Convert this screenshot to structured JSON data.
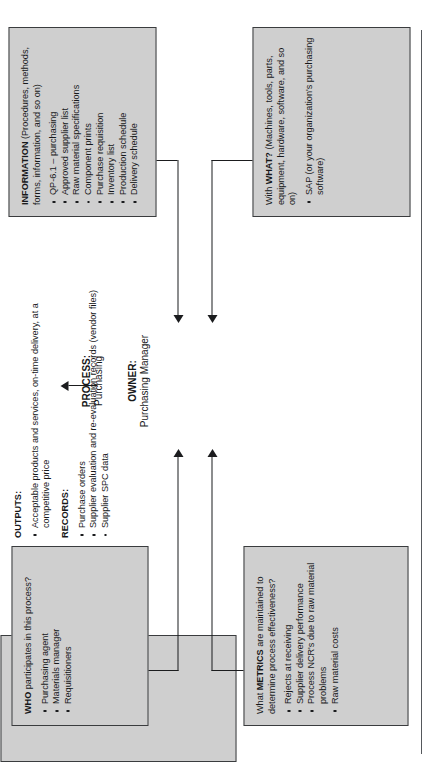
{
  "diagram": {
    "type": "process-map",
    "orientation": "rotated-90-ccw",
    "process": {
      "process_label": "PROCESS:",
      "process_value": "Purchasing",
      "owner_label": "OWNER:",
      "owner_value": "Purchasing Manager"
    },
    "who": {
      "title_prefix": "WHO",
      "title_rest": " participates in this process?",
      "items": [
        "Purchasing agent",
        "Materials manager",
        "Requisitioners"
      ]
    },
    "metrics": {
      "title_pre": "What ",
      "title_kw": "METRICS",
      "title_post": " are maintained to determine process effectiveness?",
      "items": [
        "Rejects at receiving",
        "Supplier delivery performance",
        "Process NCR's due to raw material problems",
        "Raw material costs"
      ]
    },
    "information": {
      "title_kw": "INFORMATION",
      "title_post": " (Procedures, methods, forms, information, and so on)",
      "items": [
        "QP-6.1 – purchasing",
        "Approved supplier list",
        "Raw material specifications",
        "Component prints",
        "Purchase requisition",
        "Inventory list",
        "Production schedule",
        "Delivery schedule"
      ]
    },
    "what": {
      "title_pre": "With ",
      "title_kw": "WHAT?",
      "title_post": " (Machines, tools, parts, equipment, hardware, software, and so on)",
      "items": [
        "SAP (or your organization's purchasing software)"
      ]
    },
    "outputs": {
      "heading": "OUTPUTS:",
      "items": [
        "Acceptable products and services, on-time delivery, at a competitive price"
      ]
    },
    "records": {
      "heading": "RECORDS:",
      "items": [
        "Purchase orders",
        "Supplier evaluation and re-evaluation records (vendor files)",
        "Supplier SPC data"
      ]
    },
    "colors": {
      "box_fill": "#cfcfcf",
      "box_border": "#3a3c3e",
      "text": "#17181a",
      "connector": "#1b1c1e",
      "page": "#ffffff"
    }
  }
}
